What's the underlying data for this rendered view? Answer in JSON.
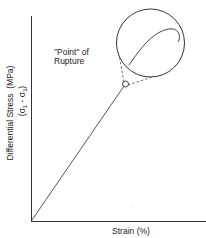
{
  "diagram": {
    "type": "stress-strain curve",
    "x_axis_label": "Strain (%)",
    "y_axis_label_line1": "Differential Stress  (MPa)",
    "y_axis_label_line2_prefix": "(σ",
    "y_axis_label_line2_sub1": "1",
    "y_axis_label_line2_mid": " - σ",
    "y_axis_label_line2_sub3": "3",
    "y_axis_label_line2_suffix": ")",
    "annotation_line1": "\"Point\" of",
    "annotation_line2": "Rupture",
    "inset_description": "magnified view of rupture point showing curve peaking and softening",
    "line_color": "#333333"
  }
}
